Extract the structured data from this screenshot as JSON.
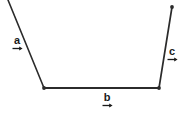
{
  "figure": {
    "background_color": "#ffffff",
    "stroke_color": "#2b2b2b",
    "label_color": "#1a1a1a",
    "canvas": {
      "width": 182,
      "height": 115
    },
    "vertices": [
      {
        "name": "start-point",
        "x": 8,
        "y": 0,
        "marker": false
      },
      {
        "name": "lower-left-vertex",
        "x": 44,
        "y": 88,
        "marker": true
      },
      {
        "name": "lower-right-vertex",
        "x": 159,
        "y": 88,
        "marker": true
      },
      {
        "name": "end-point",
        "x": 172,
        "y": 7,
        "marker": true
      }
    ],
    "segments": [
      {
        "id": "segment-a",
        "label": "a",
        "arrow_glyph": "→",
        "x1": 8,
        "y1": 0,
        "x2": 44,
        "y2": 88,
        "stroke_width": 1.6
      },
      {
        "id": "segment-b",
        "label": "b",
        "arrow_glyph": "→",
        "x1": 44,
        "y1": 88,
        "x2": 159,
        "y2": 88,
        "stroke_width": 1.9
      },
      {
        "id": "segment-c",
        "label": "c",
        "arrow_glyph": "→",
        "x1": 159,
        "y1": 88,
        "x2": 172,
        "y2": 7,
        "stroke_width": 1.7
      }
    ],
    "labels": {
      "a": {
        "text": "a",
        "x": 8,
        "y": 35
      },
      "b": {
        "text": "b",
        "x": 98,
        "y": 92
      },
      "c": {
        "text": "c",
        "x": 163,
        "y": 46
      }
    }
  }
}
